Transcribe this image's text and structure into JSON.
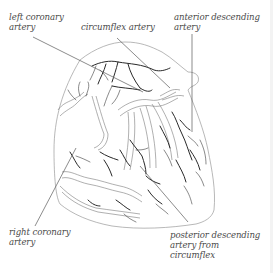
{
  "diagram": {
    "labels": {
      "left_coronary": {
        "line1": "left coronary",
        "line2": "artery"
      },
      "circumflex": {
        "line1": "circumflex artery"
      },
      "anterior_descending": {
        "line1": "anterior descending",
        "line2": "artery"
      },
      "right_coronary": {
        "line1": "right coronary",
        "line2": "artery"
      },
      "posterior_descending": {
        "line1": "posterior descending",
        "line2": "artery from",
        "line3": "circumflex"
      }
    },
    "colors": {
      "background": "#ffffff",
      "outline": "#9a9a9a",
      "vessel": "#2a2a2a",
      "label_text": "#4a4a4a",
      "leader_line": "#5a5a5a"
    }
  }
}
